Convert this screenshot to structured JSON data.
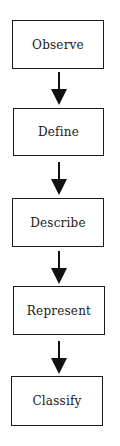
{
  "diagram": {
    "type": "vertical-flowchart",
    "steps": [
      {
        "label": "Observe"
      },
      {
        "label": "Define"
      },
      {
        "label": "Describe"
      },
      {
        "label": "Represent"
      },
      {
        "label": "Classify"
      }
    ],
    "connectors": [
      {
        "from": "Observe",
        "to": "Define"
      },
      {
        "from": "Define",
        "to": "Describe"
      },
      {
        "from": "Describe",
        "to": "Represent"
      },
      {
        "from": "Represent",
        "to": "Classify"
      }
    ],
    "colors": {
      "stroke": "#1a1a1a",
      "background": "#ffffff"
    }
  }
}
